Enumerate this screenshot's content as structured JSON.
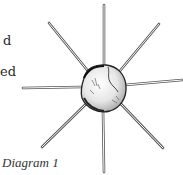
{
  "text_fragments": [
    {
      "text": "d",
      "x": 3,
      "y": 34
    },
    {
      "text": "ed",
      "x": 0,
      "y": 65
    }
  ],
  "figure": {
    "caption": "Diagram 1",
    "ball": {
      "cx": 103,
      "cy": 88,
      "rx": 22,
      "ry": 23,
      "fill": "#f4f4f4",
      "stroke": "#222222"
    },
    "sticks": [
      {
        "name": "top",
        "x1": 104,
        "y1": 66,
        "x2": 104,
        "y2": 5
      },
      {
        "name": "upper-right",
        "x1": 119,
        "y1": 72,
        "x2": 159,
        "y2": 24
      },
      {
        "name": "right",
        "x1": 125,
        "y1": 85,
        "x2": 182,
        "y2": 80
      },
      {
        "name": "lower-right",
        "x1": 121,
        "y1": 104,
        "x2": 163,
        "y2": 148
      },
      {
        "name": "bottom",
        "x1": 103,
        "y1": 111,
        "x2": 104,
        "y2": 172
      },
      {
        "name": "lower-left",
        "x1": 86,
        "y1": 104,
        "x2": 42,
        "y2": 147
      },
      {
        "name": "left",
        "x1": 81,
        "y1": 87,
        "x2": 23,
        "y2": 88
      },
      {
        "name": "upper-left",
        "x1": 88,
        "y1": 71,
        "x2": 49,
        "y2": 23
      }
    ],
    "stick_color": "#555555"
  }
}
